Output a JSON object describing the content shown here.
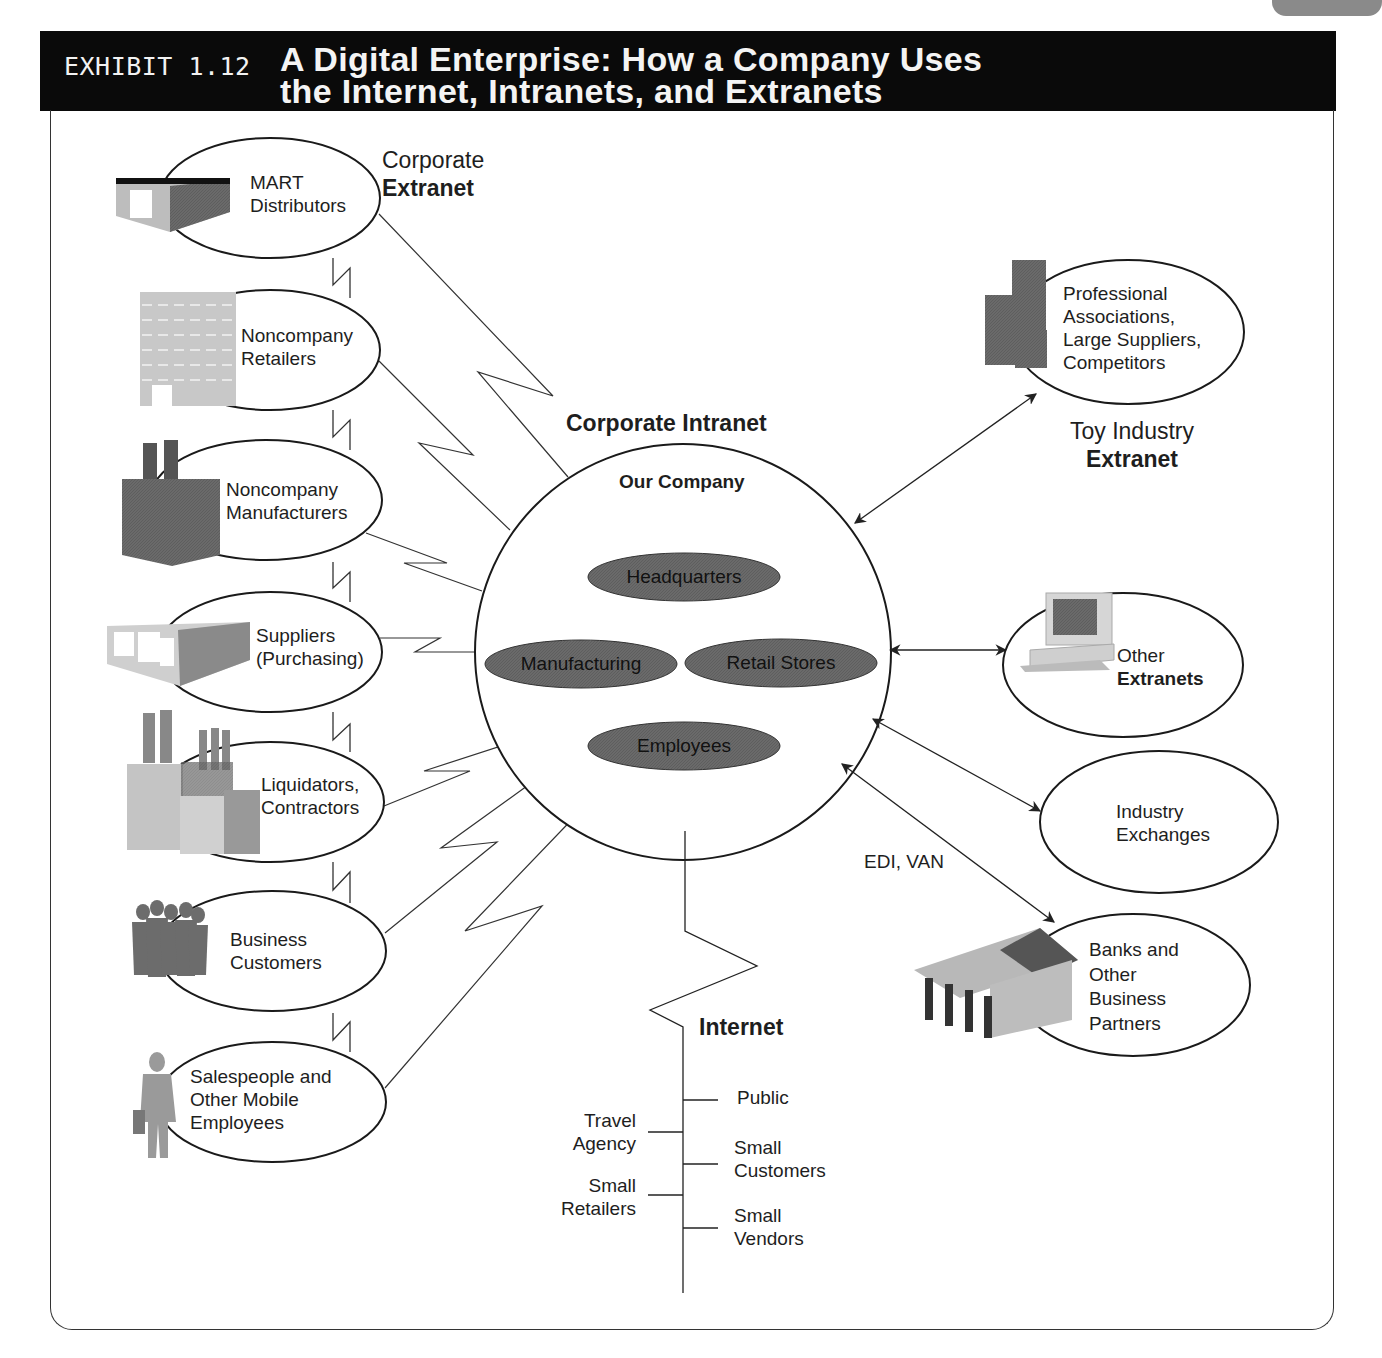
{
  "exhibit": {
    "number": "EXHIBIT 1.12",
    "title_line1": "A Digital Enterprise: How a Company Uses",
    "title_line2": "the Internet, Intranets, and Extranets"
  },
  "corporate_extranet": {
    "label_line1": "Corporate",
    "label_line2": "Extranet",
    "nodes": [
      {
        "line1": "MART",
        "line2": "Distributors",
        "icon": "warehouse-icon"
      },
      {
        "line1": "Noncompany",
        "line2": "Retailers",
        "icon": "retail-building-icon"
      },
      {
        "line1": "Noncompany",
        "line2": "Manufacturers",
        "icon": "factory-icon"
      },
      {
        "line1": "Suppliers",
        "line2": "(Purchasing)",
        "icon": "supplier-building-icon"
      },
      {
        "line1": "Liquidators,",
        "line2": "Contractors",
        "icon": "industrial-plant-icon"
      },
      {
        "line1": "Business",
        "line2": "Customers",
        "icon": "people-group-icon"
      },
      {
        "line1": "Salespeople and",
        "line2": "Other Mobile",
        "line3": "Employees",
        "icon": "businessman-icon"
      }
    ]
  },
  "corporate_intranet": {
    "label": "Corporate Intranet",
    "company": "Our Company",
    "units": [
      "Headquarters",
      "Manufacturing",
      "Retail Stores",
      "Employees"
    ]
  },
  "toy_industry_extranet": {
    "label_line1": "Toy Industry",
    "label_line2": "Extranet",
    "node": {
      "line1": "Professional",
      "line2": "Associations,",
      "line3": "Large Suppliers,",
      "line4": "Competitors",
      "icon": "office-towers-icon"
    }
  },
  "other_extranets": {
    "line1": "Other",
    "line2": "Extranets",
    "icon": "computer-icon"
  },
  "industry_exchanges": {
    "line1": "Industry",
    "line2": "Exchanges"
  },
  "banks": {
    "line1": "Banks and",
    "line2": "Other",
    "line3": "Business",
    "line4": "Partners",
    "icon": "bank-icon"
  },
  "edi_label": "EDI, VAN",
  "internet": {
    "label": "Internet",
    "right_branches": [
      {
        "line1": "Public"
      },
      {
        "line1": "Small",
        "line2": "Customers"
      },
      {
        "line1": "Small",
        "line2": "Vendors"
      }
    ],
    "left_branches": [
      {
        "line1": "Travel",
        "line2": "Agency"
      },
      {
        "line1": "Small",
        "line2": "Retailers"
      }
    ]
  },
  "colors": {
    "banner": "#0a0a0a",
    "unit_oval": "#6e6e6e",
    "line": "#222222"
  }
}
